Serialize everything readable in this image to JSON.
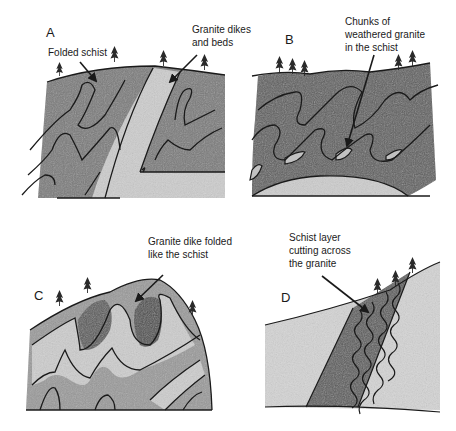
{
  "figure": {
    "panels": [
      {
        "id": "A",
        "letter": "A",
        "annotations": [
          {
            "text_lines": [
              "Folded schist"
            ]
          },
          {
            "text_lines": [
              "Granite dikes",
              "and beds"
            ]
          }
        ]
      },
      {
        "id": "B",
        "letter": "B",
        "annotations": [
          {
            "text_lines": [
              "Chunks of",
              "weathered  granite",
              "in  the schist"
            ]
          }
        ]
      },
      {
        "id": "C",
        "letter": "C",
        "annotations": [
          {
            "text_lines": [
              "Granite dike folded",
              "like the schist"
            ]
          }
        ]
      },
      {
        "id": "D",
        "letter": "D",
        "annotations": [
          {
            "text_lines": [
              "Schist layer",
              "cutting across",
              "the granite"
            ]
          }
        ]
      }
    ],
    "colors": {
      "schist_fill": "#6e6e6e",
      "granite_fill": "#cfcfcf",
      "line": "#1a1a1a",
      "background": "#ffffff"
    }
  }
}
